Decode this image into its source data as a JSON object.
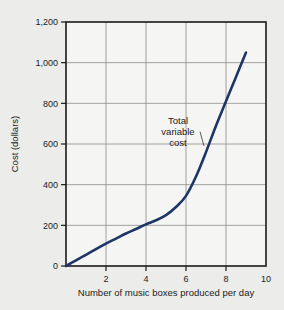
{
  "chart_data": {
    "type": "line",
    "title": "",
    "xlabel": "Number of music boxes produced per day",
    "ylabel": "Cost (dollars)",
    "xlim": [
      0,
      10
    ],
    "ylim": [
      0,
      1200
    ],
    "xticks": [
      2,
      4,
      6,
      8,
      10
    ],
    "xtick_labels": [
      "2",
      "4",
      "6",
      "8",
      "10"
    ],
    "yticks": [
      0,
      200,
      400,
      600,
      800,
      1000,
      1200
    ],
    "ytick_labels": [
      "0",
      "200",
      "400",
      "600",
      "800",
      "1,000",
      "1,200"
    ],
    "grid": true,
    "legend": null,
    "series": [
      {
        "name": "Total variable cost",
        "color": "#1f3566",
        "x": [
          0,
          0.5,
          1,
          1.5,
          2,
          2.5,
          3,
          3.5,
          4,
          4.5,
          5,
          5.5,
          6,
          6.5,
          7,
          7.5,
          8,
          8.5,
          9
        ],
        "values": [
          0,
          28,
          55,
          83,
          110,
          135,
          160,
          182,
          205,
          225,
          250,
          290,
          345,
          440,
          560,
          690,
          810,
          930,
          1050
        ]
      }
    ],
    "annotations": [
      {
        "text_lines": [
          "Total",
          "variable",
          "cost"
        ],
        "text": "Total variable cost",
        "x": 5.6,
        "y": 700,
        "leader_to_x": 6.9,
        "leader_to_y": 590
      }
    ],
    "colors": {
      "background": "#ecedeb",
      "plot_background": "#f5f6f4",
      "grid": "#8a8d8a",
      "axis": "#1a1a1a",
      "curve": "#1f3566",
      "text": "#1a1a1a"
    }
  }
}
